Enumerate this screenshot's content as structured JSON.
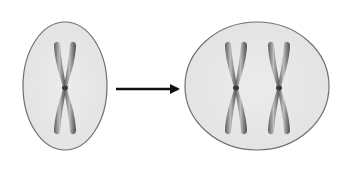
{
  "diagram": {
    "description": "Cell with one chromosome becomes cell with two chromosomes",
    "colors": {
      "background": "#ffffff",
      "cell_fill": "#e8e8e8",
      "cell_stroke": "#6f6f6f",
      "chromosome_dark": "#4a4a4a",
      "chromosome_light": "#b5b5b5",
      "arrow": "#111111"
    },
    "cells": [
      {
        "id": "cell-before",
        "label": "cell-before",
        "chromosome_count": 1,
        "cx": 65,
        "cy": 86,
        "rx": 42,
        "ry": 64,
        "chromosome_x": [
          65
        ]
      },
      {
        "id": "cell-after",
        "label": "cell-after",
        "chromosome_count": 2,
        "cx": 257,
        "cy": 86,
        "rx": 72,
        "ry": 64,
        "chromosome_x": [
          236,
          279
        ]
      }
    ],
    "arrow": {
      "icon": "right-arrow-icon",
      "x1": 116,
      "x2": 178,
      "y": 89
    }
  }
}
